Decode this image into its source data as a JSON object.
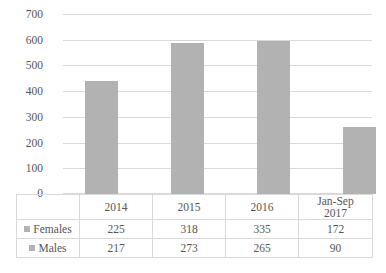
{
  "chart_data": {
    "type": "bar",
    "title": "",
    "subtitle": "",
    "xlabel": "",
    "ylabel": "",
    "categories": [
      "2014",
      "2015",
      "2016",
      "Jan-Sep 2017"
    ],
    "category_lines": [
      [
        "2014"
      ],
      [
        "2015"
      ],
      [
        "2016"
      ],
      [
        "Jan-Sep",
        "2017"
      ]
    ],
    "series": [
      {
        "name": "Females",
        "values": [
          225,
          318,
          335,
          172
        ]
      },
      {
        "name": "Males",
        "values": [
          217,
          273,
          265,
          90
        ]
      }
    ],
    "bar_totals": [
      442,
      591,
      600,
      262
    ],
    "ylim": [
      0,
      700
    ],
    "yticks": [
      0,
      100,
      200,
      300,
      400,
      500,
      600,
      700
    ],
    "ytick_labels": [
      "0",
      "100",
      "200",
      "300",
      "400",
      "500",
      "600",
      "700"
    ],
    "grid": true,
    "legend_position": "data-table-left",
    "data_table_visible": true,
    "colors": {
      "bar": "#b2b2b2",
      "gridline": "#d9d9d9",
      "text": "#565656",
      "table_border": "#d9d9d9",
      "background": "#ffffff"
    }
  },
  "axis": {
    "y_labels": [
      "700",
      "600",
      "500",
      "400",
      "300",
      "200",
      "100",
      "0"
    ]
  },
  "table": {
    "header_row": [
      "",
      "2014",
      "2015",
      "2016",
      "Jan-Sep 2017"
    ],
    "rows": [
      {
        "label": "Females",
        "values": [
          "225",
          "318",
          "335",
          "172"
        ]
      },
      {
        "label": "Males",
        "values": [
          "217",
          "273",
          "265",
          "90"
        ]
      }
    ],
    "category_cells": [
      {
        "line1": "2014",
        "line2": ""
      },
      {
        "line1": "2015",
        "line2": ""
      },
      {
        "line1": "2016",
        "line2": ""
      },
      {
        "line1": "Jan-Sep",
        "line2": "2017"
      }
    ]
  },
  "icons": {
    "females_marker": "legend-square-icon",
    "males_marker": "legend-square-icon"
  }
}
